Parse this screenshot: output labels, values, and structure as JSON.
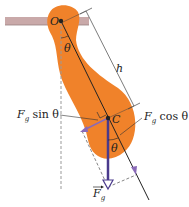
{
  "diagram": {
    "labels": {
      "pivot": "O",
      "center": "C",
      "length": "h",
      "theta_top": "θ",
      "theta_bottom": "θ",
      "force_sin": "F",
      "force_sin_sub": "g",
      "force_sin_tail": " sin θ",
      "force_cos": "F",
      "force_cos_sub": "g",
      "force_cos_tail": " cos θ",
      "gravity": "F",
      "gravity_sub": "g"
    },
    "colors": {
      "body": "#f0822a",
      "support": "#c9a9a9",
      "force_vector": "#4a3a8c",
      "component_arrow": "#8a6ab8",
      "line": "#222222"
    }
  }
}
